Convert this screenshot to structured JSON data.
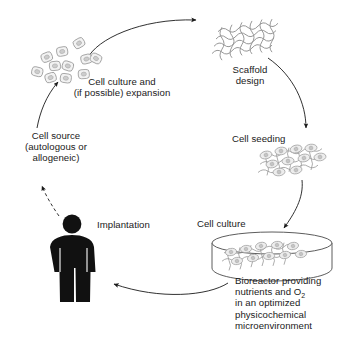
{
  "figure": {
    "background_color": "#ffffff",
    "ink_color": "#1a1a1a",
    "figure_color": "#000000",
    "sketch_color": "#8a8a8a"
  },
  "labels": {
    "cell_culture_expansion_line1": "Cell culture and",
    "cell_culture_expansion_line2": "(if possible) expansion",
    "scaffold_design_line1": "Scaffold",
    "scaffold_design_line2": "design",
    "cell_seeding": "Cell seeding",
    "cell_culture": "Cell culture",
    "bioreactor_line1": "Bioreactor providing",
    "bioreactor_line2_pre": "nutrients and O",
    "bioreactor_line2_sub": "2",
    "bioreactor_line3": "in an optimized",
    "bioreactor_line4": "physicochemical",
    "bioreactor_line5": "microenvironment",
    "cell_source_line1": "Cell source",
    "cell_source_line2": "(autologous or",
    "cell_source_line3": "allogeneic)",
    "implantation": "Implantation"
  },
  "stages": [
    {
      "id": "cell-source",
      "label": "Cell source (autologous or allogeneic)",
      "icon": "human-figure-icon"
    },
    {
      "id": "cell-culture-expansion",
      "label": "Cell culture and (if possible) expansion",
      "icon": "cell-cluster-icon"
    },
    {
      "id": "scaffold-design",
      "label": "Scaffold design",
      "icon": "scaffold-mesh-icon"
    },
    {
      "id": "cell-seeding",
      "label": "Cell seeding",
      "icon": "seeded-scaffold-icon"
    },
    {
      "id": "cell-culture-bioreactor",
      "label": "Cell culture",
      "icon": "petri-dish-icon"
    },
    {
      "id": "implantation",
      "label": "Implantation",
      "icon": "human-figure-icon"
    }
  ],
  "arrows": [
    {
      "id": "arrow-source-to-culture",
      "style": "solid",
      "from": "cell-source",
      "to": "cell-culture-expansion"
    },
    {
      "id": "arrow-culture-to-scaffold",
      "style": "solid",
      "from": "cell-culture-expansion",
      "to": "scaffold-design"
    },
    {
      "id": "arrow-scaffold-to-seeding",
      "style": "solid",
      "from": "scaffold-design",
      "to": "cell-seeding"
    },
    {
      "id": "arrow-seeding-to-bioreactor",
      "style": "solid",
      "from": "cell-seeding",
      "to": "cell-culture-bioreactor"
    },
    {
      "id": "arrow-bioreactor-to-implantation",
      "style": "solid",
      "from": "cell-culture-bioreactor",
      "to": "implantation"
    },
    {
      "id": "arrow-patient-to-source",
      "style": "dashed",
      "from": "implantation",
      "to": "cell-source"
    }
  ]
}
